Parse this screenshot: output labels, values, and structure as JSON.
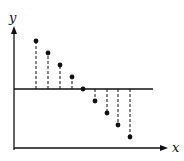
{
  "diagram": {
    "axes": {
      "x_label": "x",
      "y_label": "y"
    },
    "reference_line": "horizontal baseline",
    "stems": [
      {
        "x": 36,
        "y": 41
      },
      {
        "x": 48,
        "y": 53
      },
      {
        "x": 60,
        "y": 65
      },
      {
        "x": 72,
        "y": 77
      },
      {
        "x": 83,
        "y": 89
      },
      {
        "x": 95,
        "y": 101
      },
      {
        "x": 107,
        "y": 113
      },
      {
        "x": 118,
        "y": 125
      },
      {
        "x": 130,
        "y": 137
      }
    ],
    "colors": {
      "ink": "#111111",
      "background": "#ffffff"
    }
  }
}
